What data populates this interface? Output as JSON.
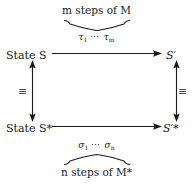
{
  "figure": {
    "type": "commutative-diagram",
    "background_color": "#ffffff",
    "ink_color": "#1a1a1a"
  },
  "captions": {
    "top": "m steps of M",
    "bottom": "n steps of M*"
  },
  "transitions": {
    "top": {
      "first": "τ",
      "first_sub": "1",
      "dots": "⋯",
      "last": "τ",
      "last_sub": "m"
    },
    "bottom": {
      "first": "σ",
      "first_sub": "1",
      "dots": "⋯",
      "last": "σ",
      "last_sub": "n"
    }
  },
  "nodes": {
    "top_left": "State S",
    "bottom_left": "State S*",
    "top_right": "S′",
    "bottom_right": "S′*"
  },
  "relations": {
    "left": "≡",
    "right": "≡"
  },
  "arrows": {
    "top": "horizontal-right-arrow",
    "bottom": "horizontal-right-arrow",
    "left": "vertical-double-headed-arrow",
    "right": "vertical-double-headed-arrow"
  },
  "braces": {
    "top": "underbrace",
    "bottom": "overbrace"
  }
}
